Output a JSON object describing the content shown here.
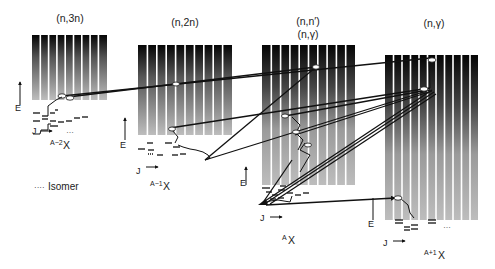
{
  "diagram": {
    "title_labels": {
      "n3n": "(n,3n)",
      "n2n": "(n,2n)",
      "nnprime": "(n,n′)",
      "ngamma_a": "(n,γ)",
      "ngamma": "(n,γ)"
    },
    "nuclei": {
      "a_minus_2": {
        "sup": "A−2",
        "sym": "X"
      },
      "a_minus_1": {
        "sup": "A−1",
        "sym": "X"
      },
      "a": {
        "sup": "A",
        "sym": "X"
      },
      "a_plus_1": {
        "sup": "A+1",
        "sym": "X"
      }
    },
    "axes": {
      "energy": "E",
      "spin": "J",
      "arrow": "→"
    },
    "legend": {
      "isomer_marker": "····",
      "isomer_label": "Isomer"
    },
    "ellipsis": "…",
    "colors": {
      "bar_top": "#0a0a0a",
      "bar_bottom": "#b8b8b8",
      "line": "#111111",
      "background": "#ffffff"
    },
    "blocks": [
      {
        "id": "n3n",
        "x": 32,
        "y": 35,
        "w": 75,
        "h": 65,
        "bars": 9
      },
      {
        "id": "n2n",
        "x": 138,
        "y": 45,
        "w": 94,
        "h": 90,
        "bars": 10
      },
      {
        "id": "nn",
        "x": 262,
        "y": 45,
        "w": 93,
        "h": 140,
        "bars": 10
      },
      {
        "id": "ng",
        "x": 385,
        "y": 55,
        "w": 93,
        "h": 165,
        "bars": 11
      }
    ]
  }
}
